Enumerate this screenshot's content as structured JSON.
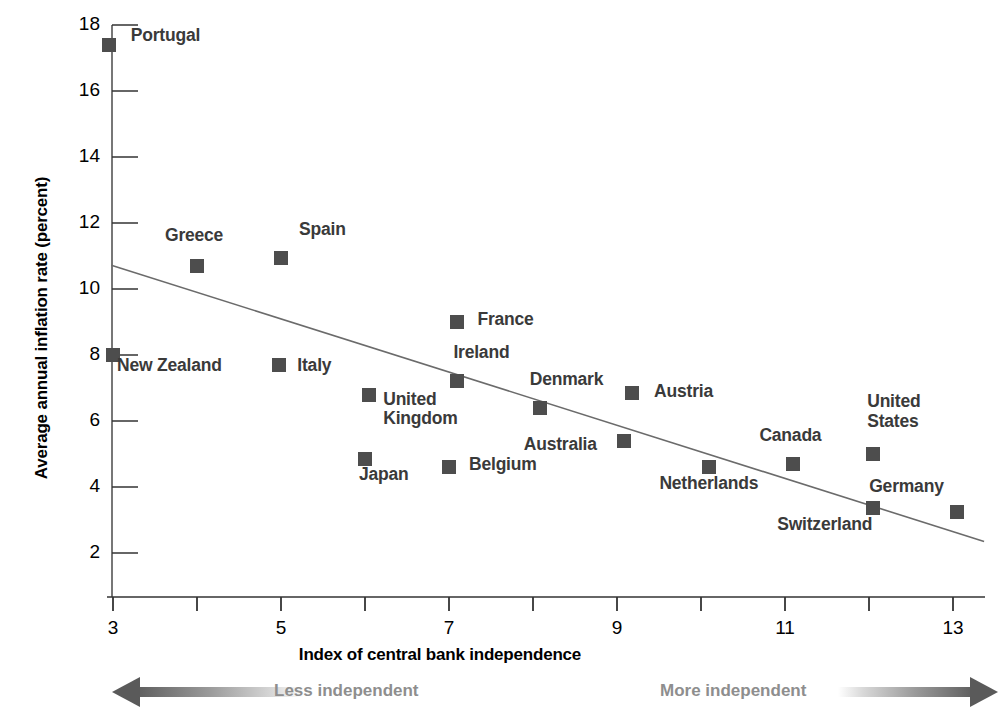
{
  "chart_data": {
    "type": "scatter",
    "title": "",
    "xlabel": "Index of central bank independence",
    "ylabel": "Average annual inflation rate (percent)",
    "xlim": [
      2.6,
      13.6
    ],
    "ylim": [
      0.7,
      18.4
    ],
    "x_ticks": [
      3,
      5,
      7,
      9,
      11,
      13
    ],
    "x_ticks_minor": [
      4,
      6,
      8,
      10,
      12
    ],
    "y_ticks": [
      2,
      4,
      6,
      8,
      10,
      12,
      14,
      16,
      18
    ],
    "grid": false,
    "legend": "none",
    "marker_color": "#4d4d4d",
    "label_color": "#3a3a3a",
    "axis_color": "#555555",
    "trendline": {
      "x_start": 2.98,
      "y_start": 10.72,
      "x_end": 13.37,
      "y_end": 2.35,
      "color": "#6b6b6b"
    },
    "points": [
      {
        "name": "Portugal",
        "x": 2.95,
        "y": 17.4,
        "label": "Portugal",
        "label_dx": 22,
        "label_dy": -9
      },
      {
        "name": "Greece",
        "x": 4.0,
        "y": 10.7,
        "label": "Greece",
        "label_dx": -32,
        "label_dy": -30
      },
      {
        "name": "Spain",
        "x": 5.0,
        "y": 10.95,
        "label": "Spain",
        "label_dx": 18,
        "label_dy": -28
      },
      {
        "name": "New Zealand",
        "x": 3.0,
        "y": 8.0,
        "label": "New Zealand",
        "label_dx": 4,
        "label_dy": 11
      },
      {
        "name": "Italy",
        "x": 4.98,
        "y": 7.7,
        "label": "Italy",
        "label_dx": 18,
        "label_dy": 1
      },
      {
        "name": "France",
        "x": 7.1,
        "y": 9.0,
        "label": "France",
        "label_dx": 20,
        "label_dy": -2
      },
      {
        "name": "Ireland",
        "x": 7.1,
        "y": 7.2,
        "label": "Ireland",
        "label_dx": -4,
        "label_dy": -28
      },
      {
        "name": "United Kingdom",
        "x": 6.05,
        "y": 6.8,
        "label": "United\nKingdom",
        "label_dx": 14,
        "label_dy": 5
      },
      {
        "name": "Denmark",
        "x": 8.08,
        "y": 6.4,
        "label": "Denmark",
        "label_dx": -10,
        "label_dy": -28
      },
      {
        "name": "Austria",
        "x": 9.18,
        "y": 6.85,
        "label": "Austria",
        "label_dx": 22,
        "label_dy": -1
      },
      {
        "name": "Japan",
        "x": 6.0,
        "y": 4.85,
        "label": "Japan",
        "label_dx": -6,
        "label_dy": 16
      },
      {
        "name": "Belgium",
        "x": 7.0,
        "y": 4.6,
        "label": "Belgium",
        "label_dx": 20,
        "label_dy": -2
      },
      {
        "name": "Australia",
        "x": 9.08,
        "y": 5.4,
        "label": "Australia",
        "label_dx": -100,
        "label_dy": 4
      },
      {
        "name": "Netherlands",
        "x": 10.1,
        "y": 4.6,
        "label": "Netherlands",
        "label_dx": -50,
        "label_dy": 17
      },
      {
        "name": "Canada",
        "x": 11.1,
        "y": 4.7,
        "label": "Canada",
        "label_dx": -34,
        "label_dy": -28
      },
      {
        "name": "United States",
        "x": 12.05,
        "y": 5.0,
        "label": "United\nStates",
        "label_dx": -6,
        "label_dy": -52
      },
      {
        "name": "Switzerland",
        "x": 12.05,
        "y": 3.35,
        "label": "Switzerland",
        "label_dx": -96,
        "label_dy": 17
      },
      {
        "name": "Germany",
        "x": 13.05,
        "y": 3.25,
        "label": "Germany",
        "label_dx": -88,
        "label_dy": -25
      }
    ],
    "annotations": [
      {
        "name": "less-independent",
        "text": "Less independent",
        "direction": "left"
      },
      {
        "name": "more-independent",
        "text": "More independent",
        "direction": "right"
      }
    ]
  }
}
